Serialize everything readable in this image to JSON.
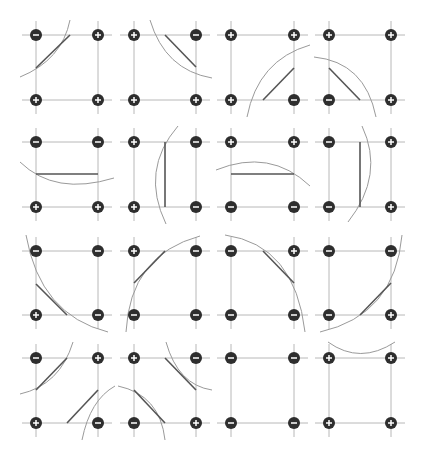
{
  "diagram": {
    "colors": {
      "background": "#ffffff",
      "grid_line": "#b8b8b8",
      "node_fill": "#2e2e2e",
      "node_glyph": "#ffffff",
      "segment": "#555555",
      "arc": "#9a9a9a"
    },
    "columns_x": [
      [
        36,
        98
      ],
      [
        134,
        196
      ],
      [
        231,
        294
      ],
      [
        329,
        391
      ]
    ],
    "rows_y": [
      [
        35,
        100
      ],
      [
        142,
        207
      ],
      [
        251,
        315
      ],
      [
        358,
        423
      ]
    ],
    "cells": [
      {
        "row": 0,
        "col": 0,
        "signs": [
          "-",
          "+",
          "+",
          "+"
        ],
        "segments": [
          [
            70,
            35,
            36,
            68
          ]
        ],
        "arcs": [
          "M 70 20 Q 62 60 20 77"
        ]
      },
      {
        "row": 0,
        "col": 1,
        "signs": [
          "+",
          "-",
          "+",
          "+"
        ],
        "segments": [
          [
            165,
            35,
            196,
            67
          ]
        ],
        "arcs": [
          "M 150 20 Q 165 70 212 78"
        ]
      },
      {
        "row": 0,
        "col": 2,
        "signs": [
          "+",
          "+",
          "+",
          "-"
        ],
        "segments": [
          [
            263,
            100,
            294,
            68
          ]
        ],
        "arcs": [
          "M 247 117 Q 258 60 310 45"
        ]
      },
      {
        "row": 0,
        "col": 3,
        "signs": [
          "+",
          "+",
          "-",
          "+"
        ],
        "segments": [
          [
            329,
            68,
            360,
            100
          ]
        ],
        "arcs": [
          "M 314 57 Q 365 62 376 117"
        ]
      },
      {
        "row": 1,
        "col": 0,
        "signs": [
          "-",
          "-",
          "+",
          "+"
        ],
        "segments": [
          [
            36,
            174,
            98,
            174
          ]
        ],
        "arcs": [
          "M 20 162 Q 55 196 114 178"
        ]
      },
      {
        "row": 1,
        "col": 1,
        "signs": [
          "+",
          "-",
          "+",
          "-"
        ],
        "segments": [
          [
            165,
            142,
            165,
            207
          ]
        ],
        "arcs": [
          "M 178 126 Q 140 170 166 224"
        ]
      },
      {
        "row": 1,
        "col": 2,
        "signs": [
          "+",
          "+",
          "-",
          "-"
        ],
        "segments": [
          [
            231,
            174,
            294,
            174
          ]
        ],
        "arcs": [
          "M 216 170 Q 270 148 310 186"
        ]
      },
      {
        "row": 1,
        "col": 3,
        "signs": [
          "-",
          "+",
          "-",
          "+"
        ],
        "segments": [
          [
            360,
            142,
            360,
            207
          ]
        ],
        "arcs": [
          "M 362 126 Q 385 175 348 222"
        ]
      },
      {
        "row": 2,
        "col": 0,
        "signs": [
          "-",
          "-",
          "+",
          "-"
        ],
        "segments": [
          [
            36,
            284,
            67,
            315
          ]
        ],
        "arcs": [
          "M 26 235 Q 40 315 108 332"
        ]
      },
      {
        "row": 2,
        "col": 1,
        "signs": [
          "+",
          "-",
          "-",
          "-"
        ],
        "segments": [
          [
            134,
            283,
            165,
            251
          ]
        ],
        "arcs": [
          "M 126 332 Q 130 255 200 236"
        ]
      },
      {
        "row": 2,
        "col": 2,
        "signs": [
          "-",
          "+",
          "-",
          "-"
        ],
        "segments": [
          [
            263,
            251,
            294,
            283
          ]
        ],
        "arcs": [
          "M 225 235 Q 295 245 305 332"
        ]
      },
      {
        "row": 2,
        "col": 3,
        "signs": [
          "-",
          "-",
          "-",
          "+"
        ],
        "segments": [
          [
            360,
            315,
            391,
            283
          ]
        ],
        "arcs": [
          "M 320 332 Q 395 315 402 235"
        ]
      }
    ],
    "cells_row3": [
      {
        "row": 3,
        "col": 0,
        "signs": [
          "-",
          "+",
          "+",
          "-"
        ],
        "segments": [
          [
            36,
            390,
            67,
            358
          ],
          [
            67,
            423,
            98,
            390
          ]
        ],
        "arcs": [
          "M 73 342 Q 60 385 20 394",
          "M 82 440 Q 90 400 115 386"
        ]
      },
      {
        "row": 3,
        "col": 1,
        "signs": [
          "+",
          "-",
          "-",
          "+"
        ],
        "segments": [
          [
            165,
            358,
            196,
            390
          ],
          [
            134,
            390,
            165,
            423
          ]
        ],
        "arcs": [
          "M 166 342 Q 178 385 212 390",
          "M 118 386 Q 160 395 165 440"
        ]
      },
      {
        "row": 3,
        "col": 2,
        "signs": [
          "-",
          "-",
          "-",
          "-"
        ],
        "segments": [],
        "arcs": []
      },
      {
        "row": 3,
        "col": 3,
        "signs": [
          "+",
          "+",
          "+",
          "+"
        ],
        "segments": [],
        "arcs": [
          "M 328 342 Q 360 365 395 342"
        ]
      }
    ]
  }
}
